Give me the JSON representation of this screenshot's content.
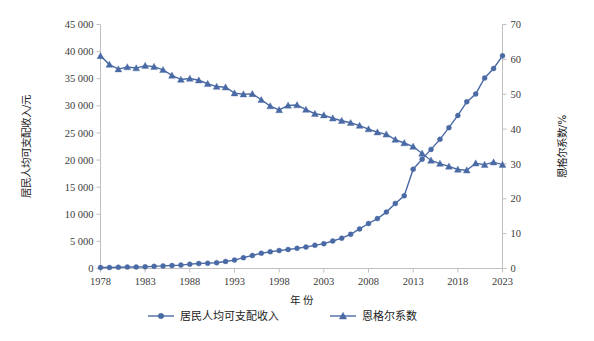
{
  "chart_data": {
    "type": "line",
    "title": "",
    "xlabel": "年 份",
    "ylabel": "居民人均可支配收入/元",
    "y2label": "恩格尔系数/%",
    "grid": false,
    "legend_position": "bottom",
    "xlim": [
      1978,
      2023
    ],
    "ylim": [
      0,
      45000
    ],
    "y2lim": [
      0,
      70
    ],
    "xticks": [
      1978,
      1983,
      1988,
      1993,
      1998,
      2003,
      2008,
      2013,
      2018,
      2023
    ],
    "yticks": [
      "0",
      "5 000",
      "10 000",
      "15 000",
      "20 000",
      "25 000",
      "30 000",
      "35 000",
      "40 000",
      "45 000"
    ],
    "ytick_values": [
      0,
      5000,
      10000,
      15000,
      20000,
      25000,
      30000,
      35000,
      40000,
      45000
    ],
    "y2ticks": [
      "0",
      "10",
      "20",
      "30",
      "40",
      "50",
      "60",
      "70"
    ],
    "y2tick_values": [
      0,
      10,
      20,
      30,
      40,
      50,
      60,
      70
    ],
    "x": [
      1978,
      1979,
      1980,
      1981,
      1982,
      1983,
      1984,
      1985,
      1986,
      1987,
      1988,
      1989,
      1990,
      1991,
      1992,
      1993,
      1994,
      1995,
      1996,
      1997,
      1998,
      1999,
      2000,
      2001,
      2002,
      2003,
      2004,
      2005,
      2006,
      2007,
      2008,
      2009,
      2010,
      2011,
      2012,
      2013,
      2014,
      2015,
      2016,
      2017,
      2018,
      2019,
      2020,
      2021,
      2022,
      2023
    ],
    "series": [
      {
        "name": "居民人均可支配收入",
        "axis": "left",
        "marker": "circle",
        "color": "#4A6AA5",
        "values": [
          171,
          186,
          238,
          264,
          285,
          321,
          396,
          480,
          540,
          630,
          804,
          917,
          983,
          1070,
          1300,
          1550,
          2000,
          2400,
          2800,
          3100,
          3300,
          3500,
          3720,
          3960,
          4270,
          4580,
          5070,
          5600,
          6300,
          7300,
          8300,
          9200,
          10400,
          12000,
          13400,
          18311,
          20167,
          21966,
          23821,
          25974,
          28228,
          30733,
          32189,
          35128,
          36883,
          39218
        ]
      },
      {
        "name": "恩格尔系数",
        "axis": "right",
        "marker": "triangle",
        "color": "#4A6AA5",
        "values": [
          61.0,
          58.5,
          57.2,
          57.8,
          57.5,
          58.2,
          57.9,
          57.0,
          55.4,
          54.2,
          54.5,
          54.0,
          53.0,
          52.2,
          52.0,
          50.3,
          50.0,
          50.1,
          48.4,
          46.6,
          45.5,
          46.8,
          46.9,
          45.6,
          44.4,
          44.0,
          43.1,
          42.4,
          41.8,
          41.0,
          40.0,
          39.1,
          38.5,
          37.0,
          36.0,
          35.0,
          33.0,
          31.0,
          30.1,
          29.3,
          28.4,
          28.2,
          30.2,
          29.8,
          30.5,
          29.8
        ]
      }
    ],
    "legend": [
      {
        "label": "居民人均可支配收入",
        "marker": "circle",
        "color": "#4A6AA5"
      },
      {
        "label": "恩格尔系数",
        "marker": "triangle",
        "color": "#4A6AA5"
      }
    ]
  }
}
